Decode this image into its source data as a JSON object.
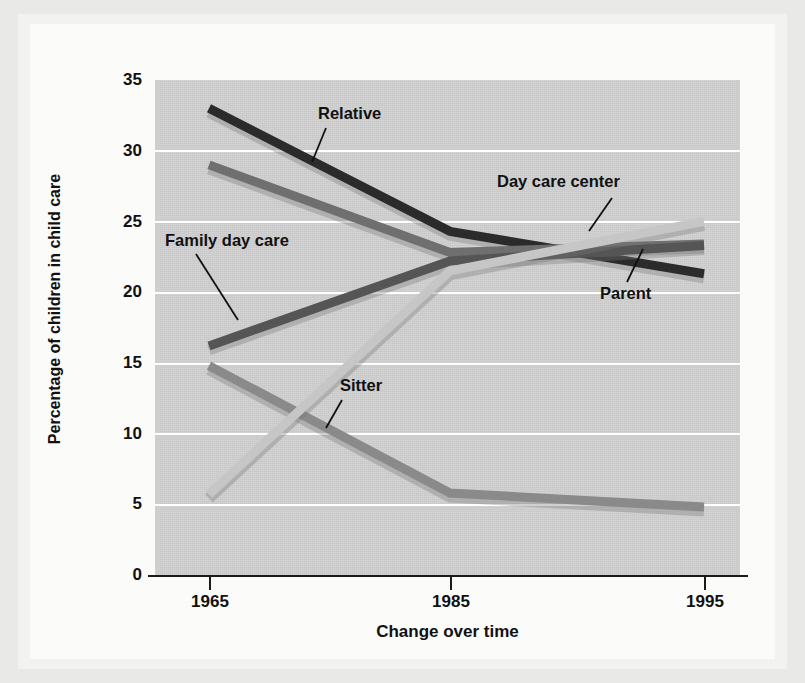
{
  "chart_data": {
    "type": "line",
    "title": "",
    "xlabel": "Change over time",
    "ylabel": "Percentage of children in child care",
    "x": [
      "1965",
      "1985",
      "1995"
    ],
    "categories": [
      "1965",
      "1985",
      "1995"
    ],
    "ylim": [
      0,
      35
    ],
    "yticks": [
      0,
      5,
      10,
      15,
      20,
      25,
      30,
      35
    ],
    "ytick_labels": [
      "0",
      "5",
      "10",
      "15",
      "20",
      "25",
      "30",
      "35"
    ],
    "grid": "horizontal",
    "legend": "inline-annotations",
    "series": [
      {
        "name": "Relative",
        "values": [
          33.0,
          24.3,
          21.3
        ],
        "color": "#2b2b2b"
      },
      {
        "name": "Parent",
        "values": [
          29.0,
          22.8,
          23.4
        ],
        "color": "#6f6f6f"
      },
      {
        "name": "Family day care",
        "values": [
          16.2,
          22.2,
          23.3
        ],
        "color": "#555555"
      },
      {
        "name": "Sitter",
        "values": [
          14.8,
          5.8,
          4.8
        ],
        "color": "#8a8a8a"
      },
      {
        "name": "Day care center",
        "values": [
          5.7,
          21.5,
          25.0
        ],
        "color": "#c6c6c6"
      }
    ],
    "annotations": [
      {
        "label": "Relative",
        "x": 318,
        "y": 113
      },
      {
        "label": "Day care center",
        "x": 497,
        "y": 182
      },
      {
        "label": "Family day care",
        "x": 171,
        "y": 240
      },
      {
        "label": "Parent",
        "x": 603,
        "y": 292
      },
      {
        "label": "Sitter",
        "x": 340,
        "y": 385
      }
    ]
  },
  "axes": {
    "x_tick_labels": [
      "1965",
      "1985",
      "1995"
    ],
    "y_tick_labels": [
      "35",
      "30",
      "25",
      "20",
      "15",
      "10",
      "5",
      "0"
    ],
    "x_title": "Change over time",
    "y_title": "Percentage of children in child care"
  },
  "colors": {
    "page_background": "#e9e9e7",
    "figure_background": "#fbfbfa",
    "plot_background": "#cfcfcf",
    "gridline": "#ffffff",
    "axis": "#1a1a1a",
    "text": "#111111"
  }
}
